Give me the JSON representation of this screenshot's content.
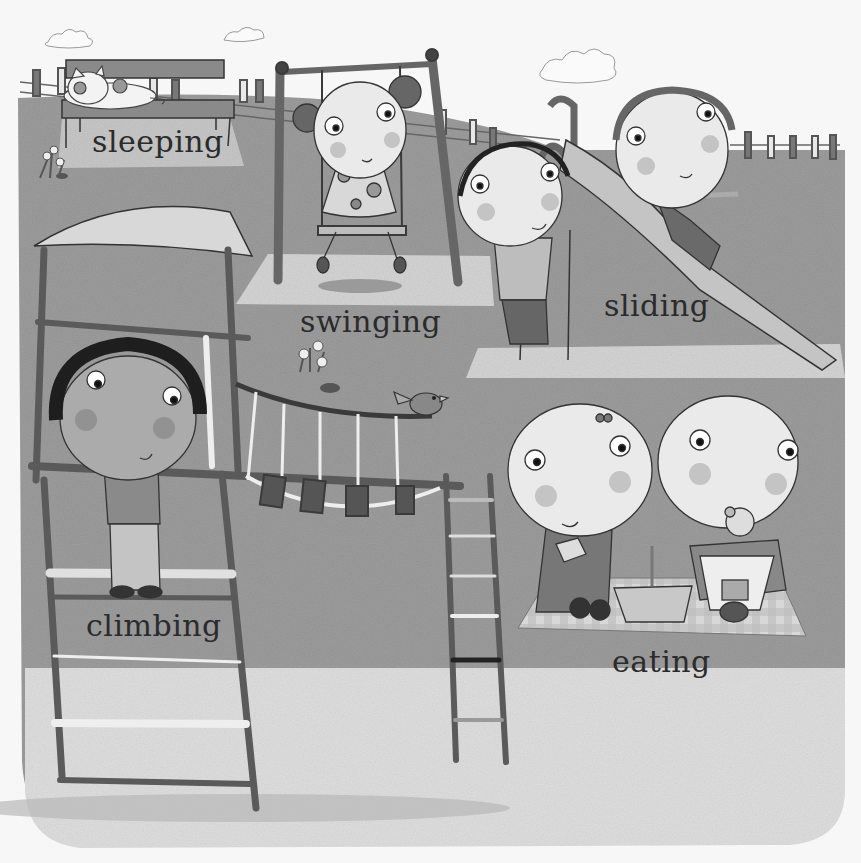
{
  "illustration": {
    "description": "Grayscale children's book illustration of a playground with children doing activities",
    "palette": {
      "sky": "#f4f4f4",
      "grass": "#9a9a9a",
      "grass_light": "#a6a6a6",
      "gravel": "#dcdcdc",
      "path": "#c8c8c8",
      "frame_dark": "#555555",
      "skin": "#e9e9e9",
      "cheek": "#bdbdbd",
      "outline": "#2f2f2f",
      "text": "#2b2b2b"
    },
    "labels": [
      {
        "id": "sleeping",
        "text": "sleeping"
      },
      {
        "id": "swinging",
        "text": "swinging"
      },
      {
        "id": "sliding",
        "text": "sliding"
      },
      {
        "id": "climbing",
        "text": "climbing"
      },
      {
        "id": "eating",
        "text": "eating"
      }
    ],
    "elements": [
      "clouds",
      "fence",
      "bench",
      "cat",
      "flowers",
      "swing-set",
      "girl-on-swing",
      "slide",
      "boy-on-ladder",
      "boy-on-slide",
      "climbing-frame",
      "canopy-roof",
      "boy-climbing",
      "rope-bridge",
      "bird",
      "ladder",
      "picnic-blanket",
      "picnic-basket",
      "girl-eating",
      "girl-with-teddy",
      "teddy-bear"
    ]
  }
}
